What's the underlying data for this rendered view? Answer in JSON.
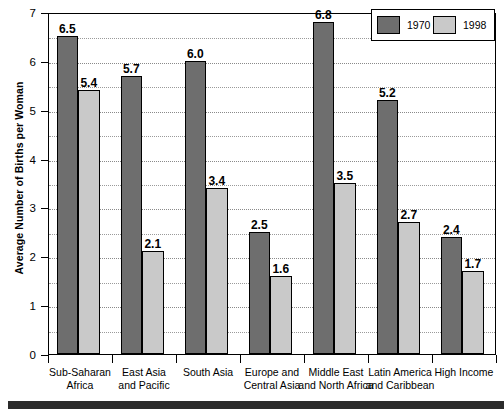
{
  "chart_data": {
    "type": "bar",
    "title": "",
    "xlabel": "",
    "ylabel": "Average Number of Births per Woman",
    "ylim": [
      0,
      7
    ],
    "ytick_labels": [
      "0",
      "1",
      "2",
      "3",
      "4",
      "5",
      "6",
      "7"
    ],
    "ytick_values": [
      0,
      1,
      2,
      3,
      4,
      5,
      6,
      7
    ],
    "gridline_interval": 0.5,
    "grid": true,
    "legend_position": "top-right",
    "categories": [
      "Sub-Saharan Africa",
      "East Asia and Pacific",
      "South Asia",
      "Europe and Central Asia",
      "Middle East and North Africa",
      "Latin America and Caribbean",
      "High Income"
    ],
    "category_lines": [
      [
        "Sub-Saharan",
        "Africa"
      ],
      [
        "East Asia",
        "and Pacific"
      ],
      [
        "South Asia",
        ""
      ],
      [
        "Europe and",
        "Central Asia"
      ],
      [
        "Middle East",
        "and North Africa"
      ],
      [
        "Latin America",
        "and Caribbean"
      ],
      [
        "High Income",
        ""
      ]
    ],
    "series": [
      {
        "name": "1970",
        "color": "#6e6e6e",
        "values": [
          6.5,
          5.7,
          6.0,
          2.5,
          6.8,
          5.2,
          2.4
        ],
        "labels": [
          "6.5",
          "5.7",
          "6.0",
          "2.5",
          "6.8",
          "5.2",
          "2.4"
        ]
      },
      {
        "name": "1998",
        "color": "#c9c9c9",
        "values": [
          5.4,
          2.1,
          3.4,
          1.6,
          3.5,
          2.7,
          1.7
        ],
        "labels": [
          "5.4",
          "2.1",
          "3.4",
          "1.6",
          "3.5",
          "2.7",
          "1.7"
        ]
      }
    ]
  },
  "legend": {
    "items": [
      {
        "label": "1970",
        "color": "#6e6e6e"
      },
      {
        "label": "1998",
        "color": "#c9c9c9"
      }
    ]
  }
}
